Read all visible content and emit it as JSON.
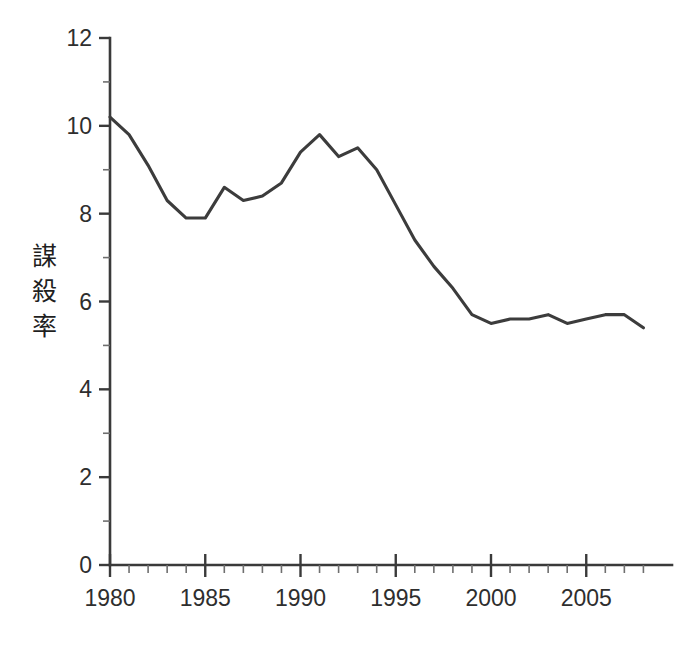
{
  "chart_data": {
    "type": "line",
    "title": "",
    "subtitle": "",
    "xlabel": "",
    "ylabel": "謀殺率",
    "ylabel_chars": [
      "謀",
      "殺",
      "率"
    ],
    "xlim": [
      1980,
      2008
    ],
    "ylim": [
      0,
      12
    ],
    "x_major_ticks": [
      1980,
      1985,
      1990,
      1995,
      2000,
      2005
    ],
    "x_major_tick_labels": [
      "1980",
      "1985",
      "1990",
      "1995",
      "2000",
      "2005"
    ],
    "x_minor_tick_step": 1,
    "y_major_ticks": [
      0,
      2,
      4,
      6,
      8,
      10,
      12
    ],
    "y_major_tick_labels": [
      "0",
      "2",
      "4",
      "6",
      "8",
      "10",
      "12"
    ],
    "y_minor_ticks": [
      1,
      3,
      5,
      7,
      9,
      11
    ],
    "grid": false,
    "legend": false,
    "legend_position": "none",
    "line_color": "#3c3c3c",
    "background_color": "#ffffff",
    "axis_color": "#3a3a3a",
    "x": [
      1980,
      1981,
      1982,
      1983,
      1984,
      1985,
      1986,
      1987,
      1988,
      1989,
      1990,
      1991,
      1992,
      1993,
      1994,
      1995,
      1996,
      1997,
      1998,
      1999,
      2000,
      2001,
      2002,
      2003,
      2004,
      2005,
      2006,
      2007,
      2008
    ],
    "series": [
      {
        "name": "謀殺率",
        "values": [
          10.2,
          9.8,
          9.1,
          8.3,
          7.9,
          7.9,
          8.6,
          8.3,
          8.4,
          8.7,
          9.4,
          9.8,
          9.3,
          9.5,
          9.0,
          8.2,
          7.4,
          6.8,
          6.3,
          5.7,
          5.5,
          5.6,
          5.6,
          5.7,
          5.5,
          5.6,
          5.7,
          5.7,
          5.4
        ]
      }
    ]
  }
}
